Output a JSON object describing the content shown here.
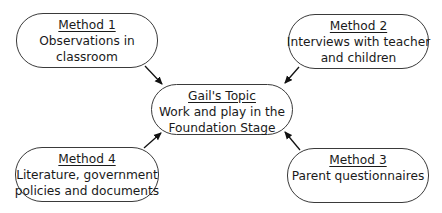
{
  "center": {
    "title": "Gail's Topic",
    "lines": [
      "Work and play in the",
      "Foundation Stage"
    ]
  },
  "methods": [
    {
      "title": "Method 1",
      "lines": [
        "Observations in",
        "classroom"
      ]
    },
    {
      "title": "Method 2",
      "lines": [
        "Interviews with teacher",
        "and children"
      ]
    },
    {
      "title": "Method 3",
      "lines": [
        "Parent questionnaires",
        ""
      ]
    },
    {
      "title": "Method 4",
      "lines": [
        "Literature, government",
        "policies and documents"
      ]
    }
  ],
  "colors": {
    "stroke": "#3a3a3a",
    "arrow": "#111111",
    "background": "#ffffff"
  }
}
